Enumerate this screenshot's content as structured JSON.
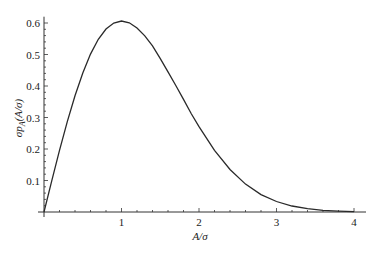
{
  "chart_data": {
    "type": "line",
    "title": "",
    "xlabel": "A/σ",
    "ylabel": "σp_A(A/σ)",
    "ylabel_parts": {
      "pre": "σp",
      "sub": "A",
      "post": "(A/σ)"
    },
    "xlim": [
      0,
      4
    ],
    "ylim": [
      0,
      0.62
    ],
    "x_ticks": [
      1,
      2,
      3,
      4
    ],
    "y_ticks": [
      0.1,
      0.2,
      0.3,
      0.4,
      0.5,
      0.6
    ],
    "grid": false,
    "legend": null,
    "series": [
      {
        "name": "Rayleigh density",
        "x": [
          0,
          0.1,
          0.2,
          0.3,
          0.4,
          0.5,
          0.6,
          0.7,
          0.8,
          0.9,
          1.0,
          1.1,
          1.2,
          1.3,
          1.4,
          1.5,
          1.6,
          1.7,
          1.8,
          1.9,
          2.0,
          2.2,
          2.4,
          2.6,
          2.8,
          3.0,
          3.2,
          3.4,
          3.6,
          3.8,
          4.0
        ],
        "values": [
          0,
          0.0995,
          0.196,
          0.2869,
          0.3692,
          0.4412,
          0.5012,
          0.5483,
          0.5809,
          0.5996,
          0.6065,
          0.6006,
          0.5841,
          0.5589,
          0.5272,
          0.487,
          0.4449,
          0.4016,
          0.3575,
          0.3118,
          0.2707,
          0.196,
          0.1348,
          0.0885,
          0.0553,
          0.0333,
          0.019,
          0.0105,
          0.0055,
          0.0028,
          0.0013
        ]
      }
    ]
  },
  "colors": {
    "line": "#2a2a2a",
    "axis": "#333333",
    "background": "#ffffff"
  }
}
